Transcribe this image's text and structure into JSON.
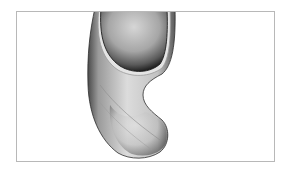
{
  "figure": {
    "colors": {
      "frame_border": "#b8b8b8",
      "background": "#ffffff",
      "shape_light": "#e6e6e6",
      "shape_mid": "#a8a8a8",
      "shape_dark": "#3a3a3a"
    }
  }
}
